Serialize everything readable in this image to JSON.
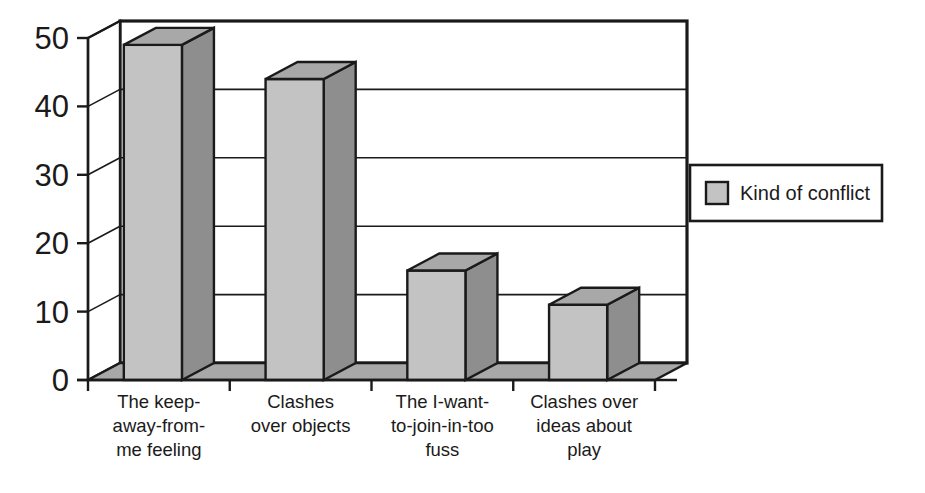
{
  "chart_data": {
    "type": "bar",
    "title": "",
    "subtitle": "",
    "xlabel": "",
    "ylabel": "",
    "ylim": [
      0,
      50
    ],
    "yticks": [
      0,
      10,
      20,
      30,
      40,
      50
    ],
    "ytick_labels": [
      "0",
      "10",
      "20",
      "30",
      "40",
      "50"
    ],
    "grid": true,
    "grid_axis": "y",
    "style": "3d-column",
    "legend_position": "right",
    "categories": [
      "The keep-away-from-me feeling",
      "Clashes over objects",
      "The I-want-to-join-in-too fuss",
      "Clashes over ideas about play"
    ],
    "category_label_lines": [
      [
        "The keep-",
        "away-from-",
        "me feeling"
      ],
      [
        "Clashes",
        "over objects"
      ],
      [
        "The I-want-",
        "to-join-in-too",
        "fuss"
      ],
      [
        "Clashes over",
        "ideas about",
        "play"
      ]
    ],
    "series": [
      {
        "name": "Kind of conflict",
        "values": [
          49,
          44,
          16,
          11
        ]
      }
    ]
  },
  "legend": {
    "entries": [
      {
        "label": "Kind of conflict",
        "swatch_color": "#c3c3c3"
      }
    ]
  },
  "colors": {
    "bar_front": "#c3c3c3",
    "bar_side": "#8e8e8e",
    "bar_top": "#a8a8a8",
    "floor": "#a8a8a8",
    "outline": "#1a1a1a",
    "background": "#ffffff",
    "plot_background": "#ffffff"
  }
}
